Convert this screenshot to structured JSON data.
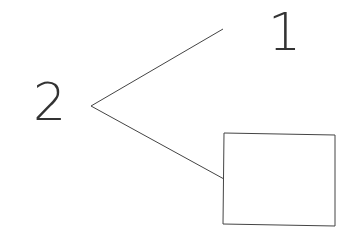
{
  "diagram": {
    "labels": {
      "node_1": "1",
      "node_2": "2"
    },
    "colors": {
      "stroke": "#444444",
      "text": "#333333",
      "background": "#ffffff"
    },
    "shapes": {
      "box": "empty rectangle"
    }
  }
}
